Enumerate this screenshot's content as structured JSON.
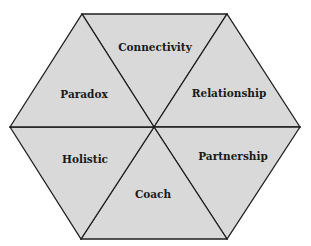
{
  "diagram": {
    "type": "hexagon-of-six-triangles",
    "fill_color": "#d9d9d9",
    "line_color": "#1e1e1e",
    "segments": [
      {
        "position": "top",
        "label": "Connectivity"
      },
      {
        "position": "top-right",
        "label": "Relationship"
      },
      {
        "position": "bottom-right",
        "label": "Partnership"
      },
      {
        "position": "bottom",
        "label": "Coach"
      },
      {
        "position": "bottom-left",
        "label": "Holistic"
      },
      {
        "position": "top-left",
        "label": "Paradox"
      }
    ]
  }
}
